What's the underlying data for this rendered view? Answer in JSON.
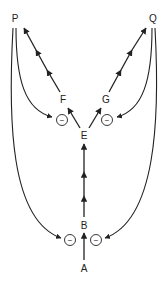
{
  "diagram": {
    "nodes": [
      {
        "id": "P",
        "label": "P",
        "x": 15,
        "y": 22
      },
      {
        "id": "Q",
        "label": "Q",
        "x": 153,
        "y": 22
      },
      {
        "id": "F",
        "label": "F",
        "x": 63,
        "y": 103
      },
      {
        "id": "G",
        "label": "G",
        "x": 106,
        "y": 103
      },
      {
        "id": "E",
        "label": "E",
        "x": 84,
        "y": 137
      },
      {
        "id": "B",
        "label": "B",
        "x": 84,
        "y": 227
      },
      {
        "id": "A",
        "label": "A",
        "x": 84,
        "y": 270
      }
    ],
    "inhibitors": [
      {
        "id": "inh-top-left",
        "symbol": "−",
        "x": 62,
        "y": 120
      },
      {
        "id": "inh-top-right",
        "symbol": "−",
        "x": 107,
        "y": 120
      },
      {
        "id": "inh-bottom-left",
        "symbol": "−",
        "x": 70,
        "y": 240
      },
      {
        "id": "inh-bottom-right",
        "symbol": "−",
        "x": 96,
        "y": 240
      }
    ],
    "edges": [
      {
        "from": "A",
        "to": "B",
        "type": "single-arrow"
      },
      {
        "from": "B",
        "to": "E",
        "type": "multi-arrow",
        "arrowheads": 3
      },
      {
        "from": "E",
        "to": "F",
        "type": "single-arrow"
      },
      {
        "from": "E",
        "to": "G",
        "type": "single-arrow"
      },
      {
        "from": "F",
        "to": "P",
        "type": "multi-arrow",
        "arrowheads": 3
      },
      {
        "from": "G",
        "to": "Q",
        "type": "multi-arrow",
        "arrowheads": 3
      },
      {
        "from": "P",
        "to": "inh-top-left",
        "type": "curved-feedback"
      },
      {
        "from": "Q",
        "to": "inh-top-right",
        "type": "curved-feedback"
      },
      {
        "from": "P",
        "to": "inh-bottom-left",
        "type": "curved-feedback"
      },
      {
        "from": "Q",
        "to": "inh-bottom-right",
        "type": "curved-feedback"
      }
    ],
    "colors": {
      "line": "#222222",
      "background": "#ffffff"
    }
  }
}
